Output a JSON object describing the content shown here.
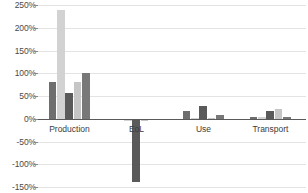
{
  "chart_data": {
    "type": "bar",
    "title": "",
    "subtitle": "",
    "xlabel": "",
    "ylabel": "",
    "grid": true,
    "legend": "none",
    "orientation": "vertical",
    "categories": [
      "Production",
      "EoL",
      "Use",
      "Transport"
    ],
    "ylim": [
      -150,
      250
    ],
    "yticks": [
      250,
      200,
      150,
      100,
      50,
      0,
      -50,
      -100,
      -150
    ],
    "ytick_labels": [
      "250%",
      "200%",
      "150%",
      "100%",
      "50%",
      "0%",
      "-50%",
      "-100%",
      "-150%"
    ],
    "series": [
      {
        "name": "Series 1",
        "color": "#6e6e6e",
        "values": [
          80,
          -3,
          17,
          3
        ]
      },
      {
        "name": "Series 2",
        "color": "#d2d2d2",
        "values": [
          238,
          -4,
          2,
          3
        ]
      },
      {
        "name": "Series 3",
        "color": "#5a5a5a",
        "values": [
          57,
          -140,
          29,
          17
        ]
      },
      {
        "name": "Series 4",
        "color": "#c6c6c6",
        "values": [
          80,
          -4,
          2,
          22
        ]
      },
      {
        "name": "Series 5",
        "color": "#787878",
        "values": [
          101,
          -3,
          8,
          3
        ]
      }
    ]
  },
  "axis": {
    "zero_line_value": "0%",
    "tick_color": "#8a8a8a",
    "grid_color": "#e3e3e3",
    "zero_line_color": "#5a5a5a"
  }
}
